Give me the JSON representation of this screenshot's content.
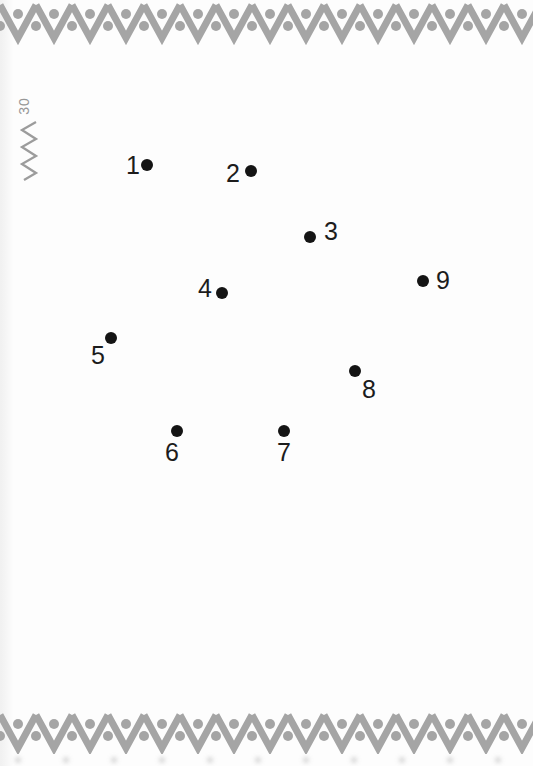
{
  "page": {
    "page_number": "30",
    "background_color": "#fdfdfd"
  },
  "decorations": {
    "border_style": "zigzag-with-dots",
    "border_color": "#a5a5a5",
    "margin_mark": "small-vertical-zigzag",
    "margin_mark_color": "#9c9c9c"
  },
  "puzzle": {
    "type": "connect-the-dots",
    "dot_color": "#141414",
    "number_color": "#1c1c1c",
    "dot_count": 9,
    "dots": [
      {
        "number": "1",
        "dot": {
          "x": 147,
          "y": 165
        },
        "label": {
          "x": 133,
          "y": 165
        }
      },
      {
        "number": "2",
        "dot": {
          "x": 251,
          "y": 171
        },
        "label": {
          "x": 233,
          "y": 173
        }
      },
      {
        "number": "3",
        "dot": {
          "x": 310,
          "y": 237
        },
        "label": {
          "x": 331,
          "y": 231
        }
      },
      {
        "number": "4",
        "dot": {
          "x": 222,
          "y": 293
        },
        "label": {
          "x": 205,
          "y": 288
        }
      },
      {
        "number": "5",
        "dot": {
          "x": 111,
          "y": 338
        },
        "label": {
          "x": 98,
          "y": 355
        }
      },
      {
        "number": "6",
        "dot": {
          "x": 177,
          "y": 431
        },
        "label": {
          "x": 172,
          "y": 452
        }
      },
      {
        "number": "7",
        "dot": {
          "x": 284,
          "y": 431
        },
        "label": {
          "x": 284,
          "y": 452
        }
      },
      {
        "number": "8",
        "dot": {
          "x": 355,
          "y": 371
        },
        "label": {
          "x": 369,
          "y": 389
        }
      },
      {
        "number": "9",
        "dot": {
          "x": 423,
          "y": 281
        },
        "label": {
          "x": 443,
          "y": 280
        }
      }
    ]
  }
}
